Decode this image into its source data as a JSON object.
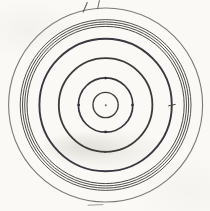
{
  "canvas": {
    "width": 210,
    "height": 211,
    "paper_color": "#faf9f5"
  },
  "drawing": {
    "center": {
      "x": 105.6,
      "y": 105.0
    },
    "circles": [
      {
        "name": "outermost-circle",
        "r": 97.0,
        "stroke": "#7d7b76",
        "width": 1.1
      },
      {
        "name": "band-circle-1",
        "r": 85.4,
        "stroke": "#55524e",
        "width": 1.0
      },
      {
        "name": "band-circle-2",
        "r": 83.1,
        "stroke": "#504d49",
        "width": 1.0
      },
      {
        "name": "band-circle-3",
        "r": 80.9,
        "stroke": "#55524e",
        "width": 1.0
      },
      {
        "name": "band-circle-4",
        "r": 78.6,
        "stroke": "#4a4744",
        "width": 1.0
      },
      {
        "name": "heavy-outer-circle",
        "r": 66.2,
        "stroke": "#39373f",
        "width": 1.9
      },
      {
        "name": "heavy-middle-circle",
        "r": 46.8,
        "stroke": "#3d3b38",
        "width": 1.8
      },
      {
        "name": "ticked-circle",
        "r": 27.2,
        "stroke": "#38363c",
        "width": 1.7
      },
      {
        "name": "innermost-circle",
        "r": 12.6,
        "stroke": "#403e3b",
        "width": 1.4
      }
    ],
    "dots": [
      {
        "name": "center-point",
        "x": 105.8,
        "y": 105.2,
        "r": 1.0,
        "fill": "#6b6862"
      },
      {
        "name": "ticked-circle-north-dot",
        "x": 105.6,
        "y": 78.1,
        "r": 1.3,
        "fill": "#2f2d33"
      },
      {
        "name": "ticked-circle-south-dot",
        "x": 105.6,
        "y": 131.9,
        "r": 1.3,
        "fill": "#2f2d33"
      },
      {
        "name": "ticked-circle-west-dot",
        "x": 78.7,
        "y": 105.0,
        "r": 1.3,
        "fill": "#2f2d33"
      },
      {
        "name": "ticked-circle-east-dot",
        "x": 132.4,
        "y": 105.0,
        "r": 1.3,
        "fill": "#2f2d33"
      },
      {
        "name": "middle-circle-south-dot",
        "x": 105.2,
        "y": 151.9,
        "r": 1.1,
        "fill": "#45433f"
      }
    ],
    "ticks": [
      {
        "name": "outer-top-hash-mark-1",
        "x1": 83.2,
        "y1": 12.0,
        "x2": 87.2,
        "y2": 2.6,
        "stroke": "#5a5852",
        "width": 1.1
      },
      {
        "name": "outer-top-hash-mark-2",
        "x1": 97.6,
        "y1": 8.8,
        "x2": 99.4,
        "y2": 0.6,
        "stroke": "#6b6963",
        "width": 1.0
      },
      {
        "name": "heavy-circle-east-tick",
        "x1": 168.6,
        "y1": 105.8,
        "x2": 175.2,
        "y2": 104.4,
        "stroke": "#46443f",
        "width": 1.0
      },
      {
        "name": "bottom-stray-dash",
        "x1": 88.0,
        "y1": 205.2,
        "x2": 103.0,
        "y2": 204.6,
        "stroke": "#a39f97",
        "width": 1.0
      }
    ]
  }
}
